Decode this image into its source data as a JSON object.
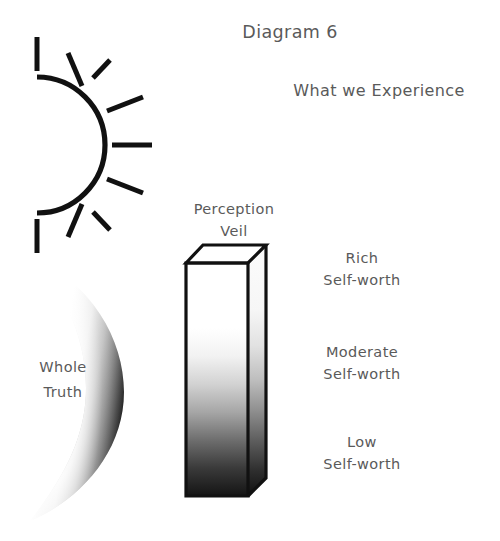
{
  "figure": {
    "title": "Diagram 6",
    "heading": "What we Experience",
    "veil_label_line1": "Perception",
    "veil_label_line2": "Veil",
    "source_label_line1": "Whole",
    "source_label_line2": "Truth",
    "levels": [
      {
        "qualifier": "Rich",
        "noun": "Self-worth"
      },
      {
        "qualifier": "Moderate",
        "noun": "Self-worth"
      },
      {
        "qualifier": "Low",
        "noun": "Self-worth"
      }
    ],
    "colors": {
      "ink": "#111111",
      "text": "#5a5a5a",
      "background": "#ffffff",
      "gradient_light": "#ffffff",
      "gradient_dark": "#000000"
    },
    "icons": {
      "sun": "sun-half-icon",
      "veil": "veil-prism-icon",
      "truth": "crescent-lens-icon"
    }
  }
}
